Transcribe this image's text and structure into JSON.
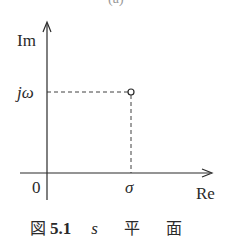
{
  "figure": {
    "top_fragment": "(a)",
    "axes": {
      "y_label": "Im",
      "x_label": "Re",
      "origin_label": "0"
    },
    "point": {
      "x_label": "σ",
      "y_label": "jω",
      "marker": "open-circle"
    },
    "caption": {
      "prefix": "図",
      "number": "5.1",
      "variable": "s",
      "word1": "平",
      "word2": "面"
    }
  },
  "colors": {
    "ink": "#2a2a2a",
    "background": "#ffffff"
  }
}
